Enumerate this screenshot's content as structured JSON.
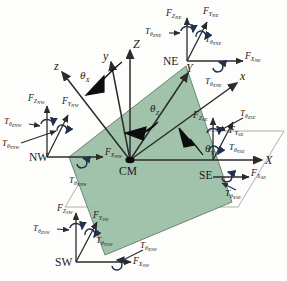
{
  "figure": {
    "center_label": "CM",
    "colors": {
      "plate_fill": "#9cc0a8",
      "plate_stroke": "#5d7a67",
      "reference_plane_stroke": "#8e8e8e",
      "torque_arc": "#23314f",
      "axis": "#2b2b2b",
      "angle_arrow": "#0d0d0d",
      "background": "#fdfdfb"
    }
  },
  "global_axes": [
    {
      "id": "X",
      "label": "X"
    },
    {
      "id": "Y",
      "label": "Y"
    },
    {
      "id": "Z",
      "label": "Z"
    }
  ],
  "body_axes": [
    {
      "id": "x",
      "label": "x"
    },
    {
      "id": "y",
      "label": "y"
    },
    {
      "id": "z",
      "label": "z"
    }
  ],
  "rotation_angles": [
    {
      "id": "theta_X",
      "symbol": "θ",
      "subscript": "X"
    },
    {
      "id": "theta_Y",
      "symbol": "θ",
      "subscript": "Y"
    },
    {
      "id": "theta_Z",
      "symbol": "θ",
      "subscript": "Z"
    }
  ],
  "corners": [
    {
      "id": "NW",
      "label": "NW",
      "forces": [
        {
          "id": "F_Z_NW",
          "symbol": "F",
          "sub": "Z",
          "subsub": "NW"
        },
        {
          "id": "F_Y_NW",
          "symbol": "F",
          "sub": "Y",
          "subsub": "NW"
        },
        {
          "id": "F_X_NW",
          "symbol": "F",
          "sub": "X",
          "subsub": "NW"
        }
      ],
      "torques": [
        {
          "id": "T_thetaZ_NW",
          "symbol": "T",
          "sub": "θ",
          "subsub": "Z",
          "corner": "NW"
        },
        {
          "id": "T_thetaY_NW",
          "symbol": "T",
          "sub": "θ",
          "subsub": "Y",
          "corner": "NW"
        },
        {
          "id": "T_thetaX_NW",
          "symbol": "T",
          "sub": "θ",
          "subsub": "X",
          "corner": "NW"
        }
      ]
    },
    {
      "id": "NE",
      "label": "NE",
      "forces": [
        {
          "id": "F_Z_NE",
          "symbol": "F",
          "sub": "Z",
          "subsub": "NE"
        },
        {
          "id": "F_Y_NE",
          "symbol": "F",
          "sub": "Y",
          "subsub": "NE"
        },
        {
          "id": "F_X_NE",
          "symbol": "F",
          "sub": "X",
          "subsub": "NE"
        }
      ],
      "torques": [
        {
          "id": "T_thetaZ_NE",
          "symbol": "T",
          "sub": "θ",
          "subsub": "Z",
          "corner": "NE"
        },
        {
          "id": "T_thetaY_NE",
          "symbol": "T",
          "sub": "θ",
          "subsub": "Y",
          "corner": "NE"
        },
        {
          "id": "T_thetaX_NE",
          "symbol": "T",
          "sub": "θ",
          "subsub": "X",
          "corner": "NE"
        }
      ]
    },
    {
      "id": "SE",
      "label": "SE",
      "forces": [
        {
          "id": "F_Z_SE",
          "symbol": "F",
          "sub": "Z",
          "subsub": "SE"
        },
        {
          "id": "F_Y_SE",
          "symbol": "F",
          "sub": "Y",
          "subsub": "SE"
        },
        {
          "id": "F_X_SE",
          "symbol": "F",
          "sub": "X",
          "subsub": "SE"
        }
      ],
      "torques": [
        {
          "id": "T_thetaZ_SE",
          "symbol": "T",
          "sub": "θ",
          "subsub": "Z",
          "corner": "SE"
        },
        {
          "id": "T_thetaY_SE",
          "symbol": "T",
          "sub": "θ",
          "subsub": "Y",
          "corner": "SE"
        },
        {
          "id": "T_thetaX_SE",
          "symbol": "T",
          "sub": "θ",
          "subsub": "X",
          "corner": "SE"
        }
      ]
    },
    {
      "id": "SW",
      "label": "SW",
      "forces": [
        {
          "id": "F_Z_SW",
          "symbol": "F",
          "sub": "Z",
          "subsub": "SW"
        },
        {
          "id": "F_Y_SW",
          "symbol": "F",
          "sub": "Y",
          "subsub": "SW"
        },
        {
          "id": "F_X_SW",
          "symbol": "F",
          "sub": "X",
          "subsub": "SW"
        }
      ],
      "torques": [
        {
          "id": "T_thetaZ_SW",
          "symbol": "T",
          "sub": "θ",
          "subsub": "Z",
          "corner": "SW"
        },
        {
          "id": "T_thetaY_SW",
          "symbol": "T",
          "sub": "θ",
          "subsub": "Y",
          "corner": "SW"
        },
        {
          "id": "T_thetaX_SW",
          "symbol": "T",
          "sub": "θ",
          "subsub": "X",
          "corner": "SW"
        }
      ]
    }
  ]
}
